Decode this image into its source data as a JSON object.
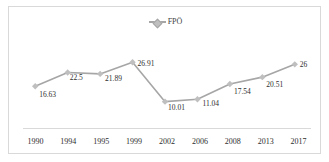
{
  "chart_data": {
    "type": "line",
    "title": "",
    "subtitle": "",
    "xlabel": "",
    "ylabel": "",
    "grid": false,
    "legend_position": "top-center",
    "categories": [
      "1990",
      "1994",
      "1995",
      "1999",
      "2002",
      "2006",
      "2008",
      "2013",
      "2017"
    ],
    "series": [
      {
        "name": "FPÖ",
        "color": "#a6a6a6",
        "marker": "diamond",
        "marker_color": "#bfbfbf",
        "values": [
          16.63,
          22.5,
          21.89,
          26.91,
          10.01,
          11.04,
          17.54,
          20.51,
          26
        ]
      }
    ],
    "data_labels": [
      "16.63",
      "22.5",
      "21.89",
      "26.91",
      "10.01",
      "11.04",
      "17.54",
      "20.51",
      "26"
    ],
    "ylim": [
      0,
      30
    ],
    "xlim_categories": 9
  },
  "legend": {
    "entries": [
      {
        "label": "FPÖ",
        "color": "#a6a6a6"
      }
    ]
  },
  "colors": {
    "line": "#a6a6a6",
    "marker_fill": "#bfbfbf",
    "marker_stroke": "#a6a6a6",
    "border": "#d9d9d9",
    "axis": "#d9d9d9",
    "text": "#2e2e2e",
    "background": "#ffffff"
  }
}
